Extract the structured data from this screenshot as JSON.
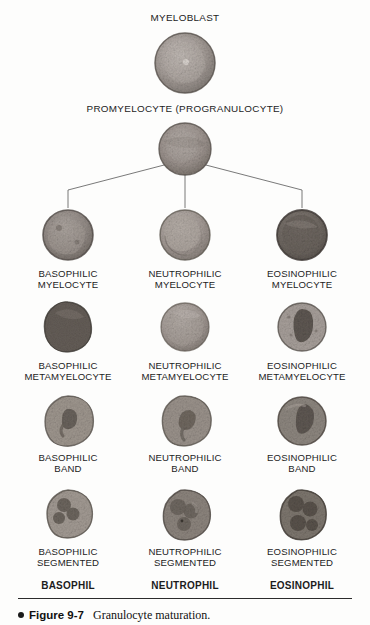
{
  "figure": {
    "number_label": "Figure 9-7",
    "caption": "Granulocyte maturation.",
    "bullet_icon": "bullet-dot-icon"
  },
  "stages": {
    "myeloblast": "MYELOBLAST",
    "promyelocyte": "PROMYELOCYTE (PROGRANULOCYTE)"
  },
  "columns": [
    {
      "key": "basophilic",
      "myelocyte": "BASOPHILIC\nMYELOCYTE",
      "metamyelocyte": "BASOPHILIC\nMETAMYELOCYTE",
      "band": "BASOPHILIC\nBAND",
      "segmented": "BASOPHILIC\nSEGMENTED",
      "mature": "BASOPHIL"
    },
    {
      "key": "neutrophilic",
      "myelocyte": "NEUTROPHILIC\nMYELOCYTE",
      "metamyelocyte": "NEUTROPHILIC\nMETAMYELOCYTE",
      "band": "NEUTROPHILIC\nBAND",
      "segmented": "NEUTROPHILIC\nSEGMENTED",
      "mature": "NEUTROPHIL"
    },
    {
      "key": "eosinophilic",
      "myelocyte": "EOSINOPHILIC\nMYELOCYTE",
      "metamyelocyte": "EOSINOPHILIC\nMETAMYELOCYTE",
      "band": "EOSINOPHILIC\nBAND",
      "segmented": "EOSINOPHILIC\nSEGMENTED",
      "mature": "EOSINOPHIL"
    }
  ],
  "colors": {
    "background": "#fdfdfc",
    "text": "#1c1c1c",
    "connector": "#6a6a6a",
    "rule": "#2b2b2b",
    "cell_cytoplasm_light": "#b9b2ad",
    "cell_cytoplasm_mid": "#9a918c",
    "cell_nucleus_dark": "#6f6862",
    "cell_outline": "#5d5752"
  },
  "cell_images": [
    {
      "name": "myeloblast-cell",
      "stage": "myeloblast",
      "lineage": "common"
    },
    {
      "name": "promyelocyte-cell",
      "stage": "promyelocyte",
      "lineage": "common"
    },
    {
      "name": "basophilic-myelocyte-cell",
      "stage": "myelocyte",
      "lineage": "basophilic"
    },
    {
      "name": "neutrophilic-myelocyte-cell",
      "stage": "myelocyte",
      "lineage": "neutrophilic"
    },
    {
      "name": "eosinophilic-myelocyte-cell",
      "stage": "myelocyte",
      "lineage": "eosinophilic"
    },
    {
      "name": "basophilic-metamyelocyte-cell",
      "stage": "metamyelocyte",
      "lineage": "basophilic"
    },
    {
      "name": "neutrophilic-metamyelocyte-cell",
      "stage": "metamyelocyte",
      "lineage": "neutrophilic"
    },
    {
      "name": "eosinophilic-metamyelocyte-cell",
      "stage": "metamyelocyte",
      "lineage": "eosinophilic"
    },
    {
      "name": "basophilic-band-cell",
      "stage": "band",
      "lineage": "basophilic"
    },
    {
      "name": "neutrophilic-band-cell",
      "stage": "band",
      "lineage": "neutrophilic"
    },
    {
      "name": "eosinophilic-band-cell",
      "stage": "band",
      "lineage": "eosinophilic"
    },
    {
      "name": "basophilic-segmented-cell",
      "stage": "segmented",
      "lineage": "basophilic"
    },
    {
      "name": "neutrophilic-segmented-cell",
      "stage": "segmented",
      "lineage": "neutrophilic"
    },
    {
      "name": "eosinophilic-segmented-cell",
      "stage": "segmented",
      "lineage": "eosinophilic"
    }
  ]
}
